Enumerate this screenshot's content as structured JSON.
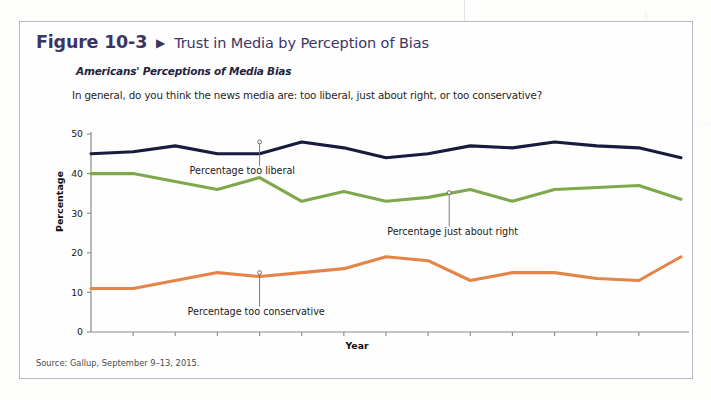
{
  "figure": {
    "label": "Figure 10-3",
    "arrow_icon": "right-triangle-icon",
    "title": "Trust in Media by Perception of Bias",
    "subtitle": "Americans' Perceptions of Media Bias",
    "question": "In general, do you think the news media are: too liberal, just about right, or too conservative?",
    "source": "Source: Gallup, September 9–13, 2015.",
    "accent_color": "#3b3566",
    "border_color": "#b9b8c4"
  },
  "chart_data": {
    "type": "line",
    "title": "Americans' Perceptions of Media Bias",
    "xlabel": "Year",
    "ylabel": "Percentage",
    "xlim": [
      2001,
      2015
    ],
    "ylim": [
      0,
      50
    ],
    "ytick_values": [
      0,
      10,
      20,
      30,
      40,
      50
    ],
    "ytick_labels": [
      "0",
      "10",
      "20",
      "30",
      "40",
      "50"
    ],
    "xtick_labels": [
      "2002",
      "2003",
      "2004",
      "2005",
      "2006",
      "2007",
      "2008",
      "2009",
      "2010",
      "2011",
      "2012",
      "2013",
      "2014"
    ],
    "grid": false,
    "legend": "inline-callout",
    "x": [
      2001,
      2002,
      2003,
      2004,
      2005,
      2006,
      2007,
      2008,
      2009,
      2010,
      2011,
      2012,
      2013,
      2014,
      2015
    ],
    "series": [
      {
        "name": "Percentage too liberal",
        "color": "#171b3d",
        "values": [
          45,
          45.5,
          47,
          45,
          45,
          48,
          46.5,
          44,
          45,
          47,
          46.5,
          48,
          47,
          46.5,
          44
        ],
        "callout_label": "Percentage too liberal",
        "callout_x": 2005,
        "callout_value": 48
      },
      {
        "name": "Percentage just about right",
        "color": "#7ea84b",
        "values": [
          40,
          40,
          38,
          36,
          39,
          33,
          35.5,
          33,
          34,
          36,
          33,
          36,
          36.5,
          37,
          33.5
        ],
        "callout_label": "Percentage just about right",
        "callout_x": 2009.5,
        "callout_value": 35.2
      },
      {
        "name": "Percentage too conservative",
        "color": "#e58448",
        "values": [
          11,
          11,
          13,
          15,
          14,
          15,
          16,
          19,
          18,
          13,
          15,
          15,
          13.5,
          13,
          19
        ],
        "callout_label": "Percentage too conservative",
        "callout_x": 2005,
        "callout_value": 15
      }
    ]
  }
}
